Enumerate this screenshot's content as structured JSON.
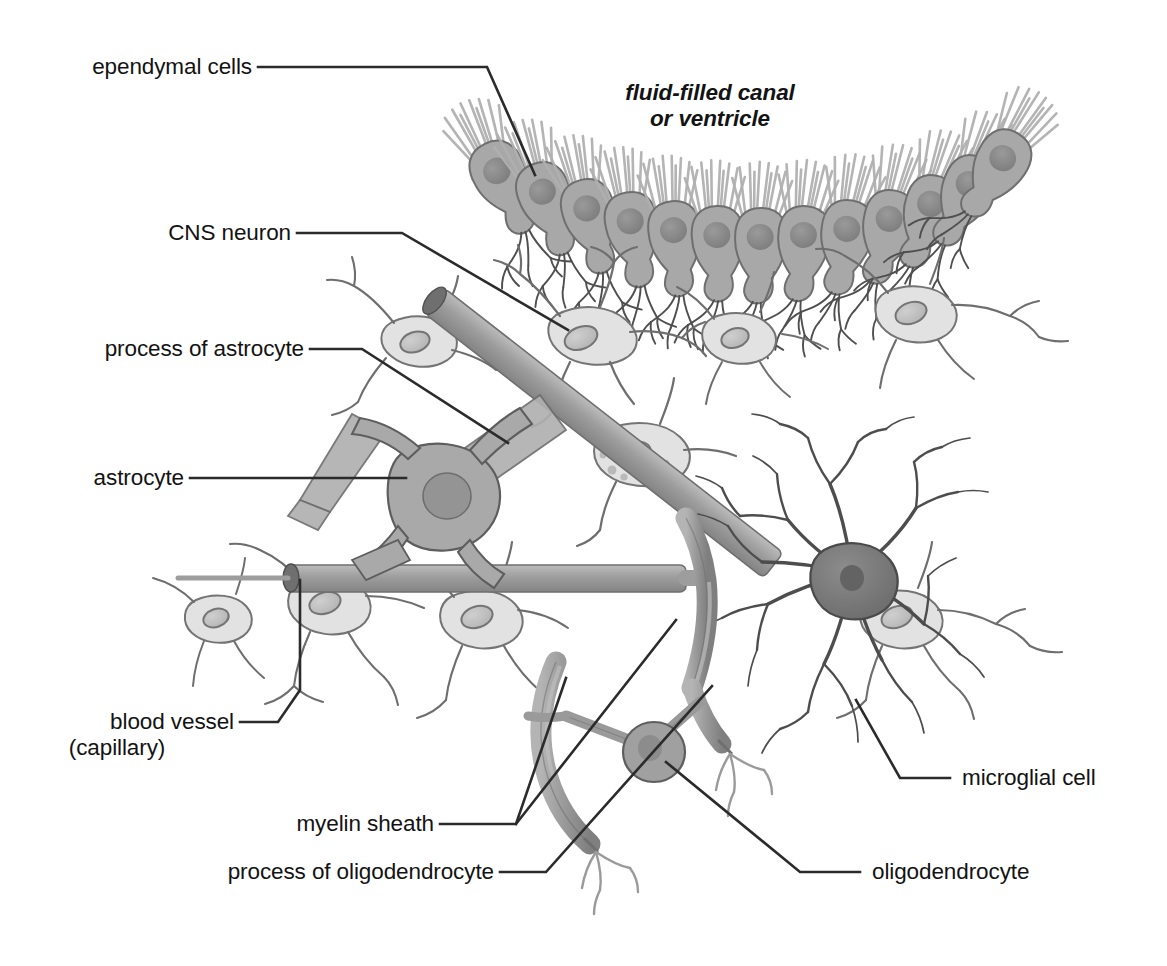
{
  "figure": {
    "background_color": "#ffffff",
    "text_color": "#131313",
    "leader_color": "#2b2b2b"
  },
  "palette": {
    "ependymal_body": "#a8a8a8",
    "ependymal_nucleus": "#8a8a8a",
    "ependymal_cilia": "#b5b5b5",
    "neuron_body": "#e2e2e2",
    "neuron_nucleus": "#c6c6c6",
    "neuron_outline": "#6d6d6d",
    "astrocyte_body": "#a9a9a9",
    "astrocyte_nucleus": "#949494",
    "astrocyte_process": "#b0b0b0",
    "microglia_body": "#7b7b7b",
    "microglia_branch": "#4d4d4d",
    "blood_vessel": "#9d9d9d",
    "blood_vessel_lumen": "#6f6f6f",
    "myelin": "#9a9a9a",
    "oligodendrocyte_body": "#a0a0a0",
    "oligodendrocyte_nucleus": "#8c8c8c"
  },
  "labels": {
    "ependymal_cells": "ependymal cells",
    "fluid_filled_canal_line1": "fluid-filled canal",
    "fluid_filled_canal_line2": "or ventricle",
    "cns_neuron": "CNS neuron",
    "process_of_astrocyte": "process of astrocyte",
    "astrocyte": "astrocyte",
    "blood_vessel_line1": "blood vessel",
    "blood_vessel_line2": "(capillary)",
    "myelin_sheath": "myelin sheath",
    "process_of_oligodendrocyte": "process of oligodendrocyte",
    "microglial_cell": "microglial cell",
    "oligodendrocyte": "oligodendrocyte"
  },
  "structures": [
    {
      "name": "ependymal-cell-layer",
      "count": 13,
      "description": "row of ciliated pear-shaped cells lining the canal"
    },
    {
      "name": "cns-neuron",
      "count": 9,
      "description": "pale star-shaped neurons with branching dendrites"
    },
    {
      "name": "astrocyte",
      "count": 1,
      "description": "gray star cell with end-feet on capillary"
    },
    {
      "name": "microglial-cell",
      "count": 1,
      "description": "small dark cell with dense spiny branches"
    },
    {
      "name": "oligodendrocyte",
      "count": 1,
      "description": "round cell wrapping two axons in myelin"
    },
    {
      "name": "blood-vessel",
      "count": 2,
      "description": "capillary tubes crossing the field"
    }
  ]
}
